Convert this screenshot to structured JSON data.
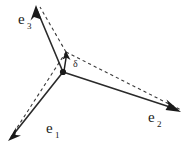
{
  "figure": {
    "type": "vector-diagram",
    "background_color": "#ffffff",
    "line_color": "#2a2a2a",
    "dashed_color": "#3a3a3a",
    "width": 195,
    "height": 146
  },
  "origin": {
    "name": "origin-node",
    "x": 63,
    "y": 72
  },
  "delta": {
    "label": "δ",
    "label_x": 73,
    "label_y": 67,
    "tip_x": 66,
    "tip_y": 52,
    "tail_x": 64,
    "tail_y": 71
  },
  "vectors": [
    {
      "id": "e1",
      "label": "e",
      "subscript": "1",
      "label_x": 46,
      "label_y": 133,
      "start_x": 63,
      "start_y": 72,
      "end_x": 10,
      "end_y": 139,
      "dashed_start_x": 66,
      "dashed_start_y": 52,
      "dashed_end_x": 11,
      "dashed_end_y": 137
    },
    {
      "id": "e2",
      "label": "e",
      "subscript": "2",
      "label_x": 148,
      "label_y": 122,
      "start_x": 63,
      "start_y": 72,
      "end_x": 180,
      "end_y": 112,
      "dashed_start_x": 66,
      "dashed_start_y": 52,
      "dashed_end_x": 181,
      "dashed_end_y": 110
    },
    {
      "id": "e3",
      "label": "e",
      "subscript": "3",
      "label_x": 18,
      "label_y": 24,
      "start_x": 63,
      "start_y": 72,
      "end_x": 36,
      "end_y": 7,
      "dashed_start_x": 66,
      "dashed_start_y": 52,
      "dashed_end_x": 40,
      "dashed_end_y": 7
    }
  ]
}
